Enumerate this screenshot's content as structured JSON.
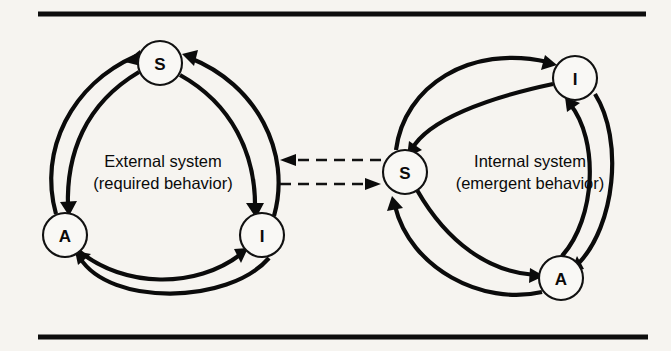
{
  "figure": {
    "title": "",
    "background_color": "#f6f4f0",
    "ink_color": "#0b0b0b",
    "width": 671,
    "height": 351
  },
  "rules": {
    "top": {
      "y": 14,
      "x1": 38,
      "x2": 646
    },
    "bottom": {
      "y": 337,
      "x1": 38,
      "x2": 648
    }
  },
  "systems": {
    "external": {
      "name": "external-system",
      "label_line1": "External system",
      "label_line2": "(required behavior)",
      "label_x": 163,
      "label_y1": 167,
      "label_y2": 189
    },
    "internal": {
      "name": "internal-system",
      "label_line1": "Internal system",
      "label_line2": "(emergent behavior)",
      "label_x": 530,
      "label_y1": 167,
      "label_y2": 189
    }
  },
  "nodes": [
    {
      "id": "ext-s",
      "label": "S",
      "cx": 160,
      "cy": 63,
      "r": 22,
      "system": "external"
    },
    {
      "id": "ext-a",
      "label": "A",
      "cx": 65,
      "cy": 235,
      "r": 22,
      "system": "external"
    },
    {
      "id": "ext-i",
      "label": "I",
      "cx": 262,
      "cy": 235,
      "r": 22,
      "system": "external"
    },
    {
      "id": "int-s",
      "label": "S",
      "cx": 405,
      "cy": 172,
      "r": 22,
      "system": "internal"
    },
    {
      "id": "int-i",
      "label": "I",
      "cx": 575,
      "cy": 78,
      "r": 22,
      "system": "internal"
    },
    {
      "id": "int-a",
      "label": "A",
      "cx": 561,
      "cy": 278,
      "r": 22,
      "system": "internal"
    }
  ],
  "edges": [
    {
      "id": "ext-a-to-s",
      "from": "A",
      "to": "S",
      "system": "external",
      "style": "solid"
    },
    {
      "id": "ext-s-to-a",
      "from": "S",
      "to": "A",
      "system": "external",
      "style": "solid"
    },
    {
      "id": "ext-s-to-i",
      "from": "S",
      "to": "I",
      "system": "external",
      "style": "solid"
    },
    {
      "id": "ext-i-to-s",
      "from": "I",
      "to": "S",
      "system": "external",
      "style": "solid"
    },
    {
      "id": "ext-a-to-i",
      "from": "A",
      "to": "I",
      "system": "external",
      "style": "solid"
    },
    {
      "id": "ext-i-to-a",
      "from": "I",
      "to": "A",
      "system": "external",
      "style": "solid"
    },
    {
      "id": "int-s-to-i",
      "from": "S",
      "to": "I",
      "system": "internal",
      "style": "solid"
    },
    {
      "id": "int-i-to-s",
      "from": "I",
      "to": "S",
      "system": "internal",
      "style": "solid"
    },
    {
      "id": "int-i-to-a",
      "from": "I",
      "to": "A",
      "system": "internal",
      "style": "solid"
    },
    {
      "id": "int-a-to-i",
      "from": "A",
      "to": "I",
      "system": "internal",
      "style": "solid"
    },
    {
      "id": "int-s-to-a",
      "from": "S",
      "to": "A",
      "system": "internal",
      "style": "solid"
    },
    {
      "id": "int-a-to-s",
      "from": "A",
      "to": "S",
      "system": "internal",
      "style": "solid"
    },
    {
      "id": "coupling-in",
      "from": "internal-system",
      "to": "external-system",
      "style": "dashed",
      "direction": "left"
    },
    {
      "id": "coupling-out",
      "from": "external-system",
      "to": "internal-system",
      "style": "dashed",
      "direction": "right"
    }
  ]
}
